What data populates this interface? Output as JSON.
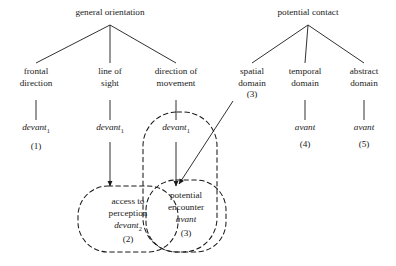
{
  "diagram": {
    "title_left": "general orientation",
    "title_right": "potential contact",
    "left_tree": {
      "root": "general orientation",
      "children": [
        {
          "label_line1": "frontal",
          "label_line2": "direction",
          "term": "devant",
          "subscript": "1",
          "number": "(1)"
        },
        {
          "label_line1": "line of",
          "label_line2": "sight",
          "term": "devant",
          "subscript": "1",
          "number": ""
        },
        {
          "label_line1": "direction of",
          "label_line2": "movement",
          "term": "devant",
          "subscript": "1",
          "number": ""
        }
      ]
    },
    "right_tree": {
      "root": "potential contact",
      "children": [
        {
          "label_line1": "spatial",
          "label_line2": "domain",
          "term": "",
          "subscript": "",
          "number": "(3)"
        },
        {
          "label_line1": "temporal",
          "label_line2": "domain",
          "term": "avant",
          "subscript": "",
          "number": "(4)"
        },
        {
          "label_line1": "abstract",
          "label_line2": "domain",
          "term": "avant",
          "subscript": "",
          "number": "(5)"
        }
      ]
    },
    "groupings": [
      {
        "name": "access-to-perception",
        "line1": "access to",
        "line2": "perception",
        "term": "devant",
        "subscript": "2",
        "number": "(2)"
      },
      {
        "name": "potential-encounter",
        "line1": "potential",
        "line2": "encounter",
        "term": "avant",
        "subscript": "",
        "number": "(3)"
      }
    ],
    "colors": {
      "line": "#1a1a1a",
      "text": "#1a1a1a",
      "background": "#ffffff"
    }
  }
}
